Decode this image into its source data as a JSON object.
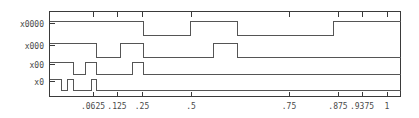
{
  "chart_data": {
    "type": "line",
    "title": "",
    "subtitle": "",
    "xlabel": "",
    "ylabel": "",
    "grid": false,
    "legend_position": "none",
    "plot_frame": {
      "left": 49,
      "top": 11,
      "right": 400,
      "bottom": 96
    },
    "xaxis": {
      "scale": "binary-reflected",
      "xlim": [
        0.03125,
        1.0
      ],
      "tick_labels": [
        ".0625",
        ".125",
        ".25",
        ".5",
        ".75",
        ".875",
        ".9375",
        "1"
      ],
      "tick_values": [
        0.0625,
        0.125,
        0.25,
        0.5,
        0.75,
        0.875,
        0.9375,
        1
      ],
      "tick_positions_px": [
        93,
        117,
        142,
        191,
        289,
        338,
        362,
        387
      ]
    },
    "yaxis": {
      "tick_labels": [
        "x0000",
        "x000",
        "x00",
        "x0"
      ],
      "tick_positions_px": [
        23,
        45,
        64,
        81
      ]
    },
    "series": [
      {
        "name": "x0000",
        "label": "x0000",
        "baseline_px": 35,
        "high_px": 21,
        "steps_px": [
          [
            49,
            1
          ],
          [
            143,
            0
          ],
          [
            190,
            1
          ],
          [
            237,
            0
          ],
          [
            333,
            1
          ],
          [
            400,
            1
          ]
        ]
      },
      {
        "name": "x000",
        "label": "x000",
        "baseline_px": 57,
        "high_px": 43,
        "steps_px": [
          [
            49,
            1
          ],
          [
            96,
            0
          ],
          [
            120,
            1
          ],
          [
            143,
            0
          ],
          [
            213,
            1
          ],
          [
            237,
            0
          ],
          [
            400,
            0
          ]
        ]
      },
      {
        "name": "x00",
        "label": "x00",
        "baseline_px": 74,
        "high_px": 62,
        "steps_px": [
          [
            49,
            1
          ],
          [
            73,
            0
          ],
          [
            85,
            1
          ],
          [
            96,
            0
          ],
          [
            132,
            1
          ],
          [
            143,
            0
          ],
          [
            400,
            0
          ]
        ]
      },
      {
        "name": "x0",
        "label": "x0",
        "baseline_px": 90,
        "high_px": 79,
        "steps_px": [
          [
            49,
            1
          ],
          [
            61,
            0
          ],
          [
            67,
            1
          ],
          [
            73,
            0
          ],
          [
            91,
            1
          ],
          [
            96,
            0
          ],
          [
            400,
            0
          ]
        ]
      }
    ]
  },
  "colors": {
    "trace": "#555555",
    "axis": "#3a3a3a",
    "label": "#4a4a4a",
    "background": "#ffffff"
  }
}
